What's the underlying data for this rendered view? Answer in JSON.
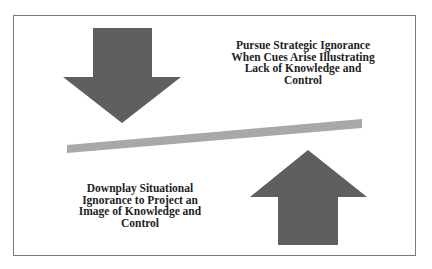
{
  "diagram": {
    "top_right_text": "Pursue Strategic Ignorance When Cues Arise Illustrating Lack of Knowledge and Control",
    "bottom_left_text": "Downplay Situational Ignorance to Project an Image of Knowledge and Control",
    "arrows": [
      {
        "direction": "down",
        "position": "top-left"
      },
      {
        "direction": "up",
        "position": "bottom-right"
      }
    ],
    "balance_bar": {
      "orientation": "tilted, rising to the right"
    },
    "colors": {
      "arrow": "#5f5f5f",
      "bar": "#a8a8a8",
      "border": "#7a7a7a",
      "text": "#1e1e1e"
    }
  }
}
